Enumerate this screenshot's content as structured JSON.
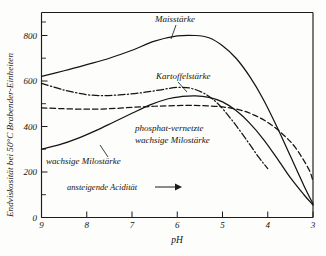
{
  "chart_data": {
    "type": "line",
    "title": "",
    "subtitle": "",
    "xlabel": "pH",
    "ylabel": "Endviskosität bei 50°C Brabender-Einheiten",
    "xlim": [
      9,
      3
    ],
    "ylim": [
      0,
      900
    ],
    "x_axis_reversed": true,
    "grid": false,
    "legend_position": "inline-annotations",
    "xticks": [
      "9",
      "8",
      "7",
      "6",
      "5",
      "4",
      "3"
    ],
    "xtick_values": [
      9,
      8,
      7,
      6,
      5,
      4,
      3
    ],
    "yticks": [
      "0",
      "200",
      "400",
      "600",
      "800"
    ],
    "ytick_values": [
      0,
      200,
      400,
      600,
      800
    ],
    "y_minor_ticks": [
      100,
      300,
      500,
      700,
      900
    ],
    "annotations": [
      {
        "text": "ansteigende Acidität",
        "arrow": "→",
        "x": 7.0,
        "y": 175
      }
    ],
    "series": [
      {
        "name": "Maisstärke",
        "label_x": 6.3,
        "label_y": 880,
        "linestyle": "solid",
        "x": [
          9.0,
          8.5,
          8.0,
          7.5,
          7.0,
          6.5,
          6.0,
          5.6,
          5.3,
          5.0,
          4.7,
          4.4,
          4.1,
          3.8,
          3.5,
          3.2,
          3.0
        ],
        "y": [
          620,
          645,
          672,
          700,
          735,
          775,
          798,
          800,
          790,
          755,
          700,
          620,
          520,
          400,
          270,
          140,
          60
        ]
      },
      {
        "name": "Kartoffelstärke",
        "label_x": 6.2,
        "label_y": 640,
        "linestyle": "dashdot",
        "x": [
          9.0,
          8.5,
          8.0,
          7.6,
          7.2,
          6.8,
          6.4,
          6.0,
          5.7,
          5.4,
          5.1,
          4.8,
          4.5,
          4.2,
          4.0
        ],
        "y": [
          590,
          560,
          540,
          536,
          540,
          548,
          560,
          572,
          568,
          545,
          500,
          430,
          350,
          265,
          215
        ]
      },
      {
        "name": "phosphat-vernetzte wachsige Milostärke",
        "label_x": 6.6,
        "label_y": 430,
        "linestyle": "dashed",
        "x": [
          9.0,
          8.5,
          8.0,
          7.5,
          7.0,
          6.5,
          6.0,
          5.5,
          5.0,
          4.6,
          4.3,
          4.0,
          3.7,
          3.4,
          3.1,
          3.0
        ],
        "y": [
          482,
          478,
          476,
          478,
          484,
          489,
          492,
          492,
          486,
          472,
          450,
          418,
          372,
          310,
          215,
          160
        ]
      },
      {
        "name": "wachsige Milostärke",
        "label_x": 8.2,
        "label_y": 245,
        "linestyle": "solid",
        "x": [
          9.0,
          8.6,
          8.2,
          7.8,
          7.4,
          7.0,
          6.6,
          6.2,
          5.9,
          5.6,
          5.3,
          5.0,
          4.7,
          4.4,
          4.1,
          3.8,
          3.5,
          3.2,
          3.0
        ],
        "y": [
          300,
          320,
          348,
          382,
          420,
          458,
          495,
          522,
          532,
          535,
          528,
          508,
          470,
          415,
          345,
          262,
          175,
          100,
          55
        ]
      }
    ]
  }
}
